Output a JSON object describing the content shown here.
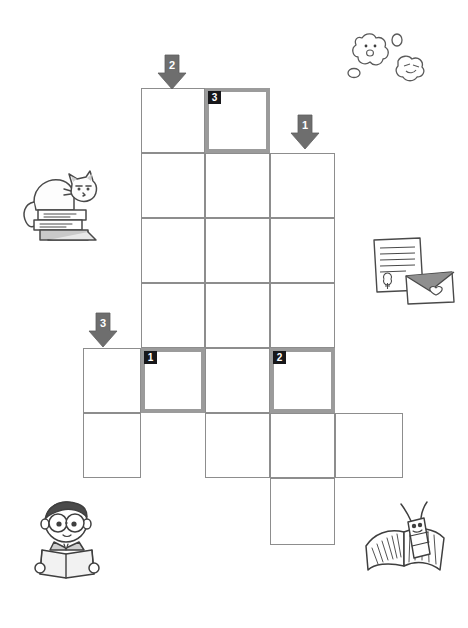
{
  "worksheet": {
    "type": "crossword-puzzle",
    "title": "",
    "grid": {
      "columns": 5,
      "rows": 7,
      "cell_size": 64,
      "origin_x": 83,
      "origin_y": 88,
      "col_x": [
        83,
        141,
        205,
        270,
        335
      ],
      "row_y": [
        88,
        153,
        218,
        283,
        348,
        413,
        478
      ],
      "col_w": [
        58,
        64,
        65,
        65,
        68
      ],
      "row_h": [
        65,
        65,
        65,
        65,
        65,
        65,
        67
      ],
      "cells": [
        {
          "row": 0,
          "col": 1,
          "highlight": false,
          "number": ""
        },
        {
          "row": 0,
          "col": 2,
          "highlight": true,
          "number": "3"
        },
        {
          "row": 1,
          "col": 1,
          "highlight": false,
          "number": ""
        },
        {
          "row": 1,
          "col": 2,
          "highlight": false,
          "number": ""
        },
        {
          "row": 1,
          "col": 3,
          "highlight": false,
          "number": ""
        },
        {
          "row": 2,
          "col": 1,
          "highlight": false,
          "number": ""
        },
        {
          "row": 2,
          "col": 2,
          "highlight": false,
          "number": ""
        },
        {
          "row": 2,
          "col": 3,
          "highlight": false,
          "number": ""
        },
        {
          "row": 3,
          "col": 1,
          "highlight": false,
          "number": ""
        },
        {
          "row": 3,
          "col": 2,
          "highlight": false,
          "number": ""
        },
        {
          "row": 3,
          "col": 3,
          "highlight": false,
          "number": ""
        },
        {
          "row": 4,
          "col": 0,
          "highlight": false,
          "number": ""
        },
        {
          "row": 4,
          "col": 1,
          "highlight": true,
          "number": "1"
        },
        {
          "row": 4,
          "col": 2,
          "highlight": false,
          "number": ""
        },
        {
          "row": 4,
          "col": 3,
          "highlight": true,
          "number": "2"
        },
        {
          "row": 5,
          "col": 0,
          "highlight": false,
          "number": ""
        },
        {
          "row": 5,
          "col": 2,
          "highlight": false,
          "number": ""
        },
        {
          "row": 5,
          "col": 3,
          "highlight": false,
          "number": ""
        },
        {
          "row": 5,
          "col": 4,
          "highlight": false,
          "number": ""
        },
        {
          "row": 6,
          "col": 3,
          "highlight": false,
          "number": ""
        }
      ]
    },
    "arrows": [
      {
        "id": "arrow-2",
        "label": "2",
        "x": 157,
        "y": 54,
        "direction": "down",
        "points_to_column": 1
      },
      {
        "id": "arrow-1",
        "label": "1",
        "x": 290,
        "y": 114,
        "direction": "down",
        "points_to_column": 3
      },
      {
        "id": "arrow-3",
        "label": "3",
        "x": 88,
        "y": 312,
        "direction": "down",
        "points_to_column": 0
      }
    ],
    "colors": {
      "cell_border": "#8d8d8d",
      "highlight_border": "#9b9b9b",
      "badge_background": "#17171a",
      "badge_text": "#ffffff",
      "arrow_fill": "#6e6e6e",
      "arrow_text": "#ffffff",
      "page_background": "#ffffff",
      "illustration_ink": "#4a4a4a"
    },
    "illustrations": [
      {
        "id": "cat-on-books",
        "name": "cat-on-books-illustration",
        "x": 14,
        "y": 162,
        "w": 92,
        "h": 88
      },
      {
        "id": "flower-clouds",
        "name": "flower-clouds-illustration",
        "x": 340,
        "y": 28,
        "w": 96,
        "h": 64
      },
      {
        "id": "letter-envelope",
        "name": "letter-envelope-illustration",
        "x": 366,
        "y": 234,
        "w": 92,
        "h": 76
      },
      {
        "id": "boy-reading",
        "name": "boy-reading-illustration",
        "x": 26,
        "y": 498,
        "w": 84,
        "h": 84
      },
      {
        "id": "bookworm",
        "name": "bookworm-illustration",
        "x": 360,
        "y": 500,
        "w": 96,
        "h": 80
      }
    ]
  }
}
